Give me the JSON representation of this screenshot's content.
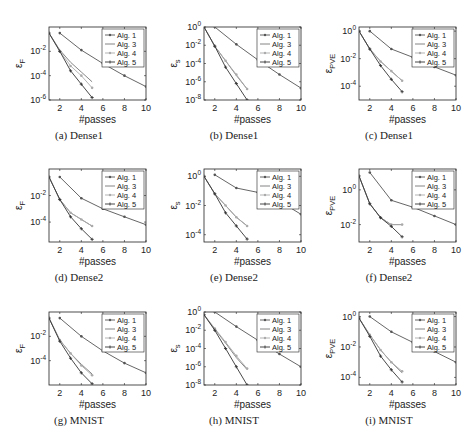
{
  "figure": {
    "panels": [
      {
        "id": "a",
        "caption": "(a) Dense1",
        "ylabel": "ε_F",
        "ylabel_main": "ε",
        "ylabel_sub": "F",
        "xlabel": "#passes"
      },
      {
        "id": "b",
        "caption": "(b) Dense1",
        "ylabel": "ε_s",
        "ylabel_main": "ε",
        "ylabel_sub": "s",
        "xlabel": "#passes"
      },
      {
        "id": "c",
        "caption": "(c) Dense1",
        "ylabel": "ε_PVE",
        "ylabel_main": "ε",
        "ylabel_sub": "PVE",
        "xlabel": "#passes"
      },
      {
        "id": "d",
        "caption": "(d) Dense2",
        "ylabel": "ε_F",
        "ylabel_main": "ε",
        "ylabel_sub": "F",
        "xlabel": "#passes"
      },
      {
        "id": "e",
        "caption": "(e) Dense2",
        "ylabel": "ε_s",
        "ylabel_main": "ε",
        "ylabel_sub": "s",
        "xlabel": "#passes"
      },
      {
        "id": "f",
        "caption": "(f) Dense2",
        "ylabel": "ε_PVE",
        "ylabel_main": "ε",
        "ylabel_sub": "PVE",
        "xlabel": "#passes"
      },
      {
        "id": "g",
        "caption": "(g) MNIST",
        "ylabel": "ε_F",
        "ylabel_main": "ε",
        "ylabel_sub": "F",
        "xlabel": "#passes"
      },
      {
        "id": "h",
        "caption": "(h) MNIST",
        "ylabel": "ε_s",
        "ylabel_main": "ε",
        "ylabel_sub": "s",
        "xlabel": "#passes"
      },
      {
        "id": "i",
        "caption": "(i) MNIST",
        "ylabel": "ε_PVE",
        "ylabel_main": "ε",
        "ylabel_sub": "PVE",
        "xlabel": "#passes"
      }
    ],
    "legend": [
      "Alg. 1",
      "Alg. 3",
      "Alg. 4",
      "Alg. 5"
    ],
    "colors": {
      "alg1": "#555555",
      "alg3": "#777777",
      "alg4": "#aaaaaa",
      "alg5": "#333333",
      "axis": "#222222"
    }
  },
  "chart_data": [
    {
      "id": "a",
      "type": "line",
      "title": "(a) Dense1",
      "xlabel": "#passes",
      "ylabel": "ε_F",
      "yscale": "log",
      "xlim": [
        1,
        10
      ],
      "ylim_exp": [
        -6,
        0
      ],
      "xticks": [
        2,
        4,
        6,
        8,
        10
      ],
      "yticks": [
        "10^-2",
        "10^-4",
        "10^-6"
      ],
      "series": [
        {
          "name": "Alg. 1",
          "x": [
            2,
            4,
            6,
            8,
            10
          ],
          "y_exp": [
            -0.5,
            -1.9,
            -3.0,
            -4.0,
            -4.9
          ]
        },
        {
          "name": "Alg. 3",
          "x": [
            1,
            2,
            3,
            4,
            5
          ],
          "y_exp": [
            -0.5,
            -1.9,
            -2.9,
            -3.7,
            -4.5
          ]
        },
        {
          "name": "Alg. 4",
          "x": [
            1,
            2,
            3,
            4,
            5
          ],
          "y_exp": [
            -0.5,
            -2.0,
            -3.2,
            -4.0,
            -5.0
          ]
        },
        {
          "name": "Alg. 5",
          "x": [
            1,
            2,
            3,
            4,
            5
          ],
          "y_exp": [
            -0.5,
            -2.0,
            -3.6,
            -4.7,
            -5.8
          ]
        }
      ]
    },
    {
      "id": "b",
      "type": "line",
      "title": "(b) Dense1",
      "xlabel": "#passes",
      "ylabel": "ε_s",
      "yscale": "log",
      "xlim": [
        1,
        10
      ],
      "ylim_exp": [
        -8,
        0
      ],
      "xticks": [
        2,
        4,
        6,
        8,
        10
      ],
      "yticks": [
        "10^0",
        "10^-2",
        "10^-4",
        "10^-6",
        "10^-8"
      ],
      "series": [
        {
          "name": "Alg. 1",
          "x": [
            2,
            4,
            6,
            8,
            10
          ],
          "y_exp": [
            0,
            -1.9,
            -3.6,
            -5.2,
            -6.7
          ]
        },
        {
          "name": "Alg. 3",
          "x": [
            1,
            2,
            3,
            4,
            5
          ],
          "y_exp": [
            0,
            -2.1,
            -3.7,
            -5.3,
            -6.8
          ]
        },
        {
          "name": "Alg. 4",
          "x": [
            1,
            2,
            3,
            4,
            5
          ],
          "y_exp": [
            0,
            -2.1,
            -3.7,
            -5.2,
            -6.8
          ]
        },
        {
          "name": "Alg. 5",
          "x": [
            1,
            2,
            3,
            4,
            5
          ],
          "y_exp": [
            0,
            -2.1,
            -4.4,
            -6.2,
            -8.0
          ]
        }
      ]
    },
    {
      "id": "c",
      "type": "line",
      "title": "(c) Dense1",
      "xlabel": "#passes",
      "ylabel": "ε_PVE",
      "yscale": "log",
      "xlim": [
        1,
        10
      ],
      "ylim_exp": [
        -5,
        0.3
      ],
      "xticks": [
        2,
        4,
        6,
        8,
        10
      ],
      "yticks": [
        "10^0",
        "10^-2",
        "10^-4"
      ],
      "series": [
        {
          "name": "Alg. 1",
          "x": [
            2,
            4,
            6,
            8,
            10
          ],
          "y_exp": [
            0,
            -1.3,
            -1.9,
            -2.6,
            -3.2
          ]
        },
        {
          "name": "Alg. 3",
          "x": [
            1,
            2,
            3,
            4,
            5
          ],
          "y_exp": [
            0,
            -1.3,
            -2.2,
            -2.9,
            -3.6
          ]
        },
        {
          "name": "Alg. 4",
          "x": [
            1,
            2,
            3,
            4,
            5
          ],
          "y_exp": [
            0,
            -1.3,
            -2.2,
            -2.9,
            -3.6
          ]
        },
        {
          "name": "Alg. 5",
          "x": [
            1,
            2,
            3,
            4,
            5
          ],
          "y_exp": [
            0,
            -1.3,
            -2.5,
            -3.5,
            -4.4
          ]
        }
      ]
    },
    {
      "id": "d",
      "type": "line",
      "title": "(d) Dense2",
      "xlabel": "#passes",
      "ylabel": "ε_F",
      "yscale": "log",
      "xlim": [
        1,
        10
      ],
      "ylim_exp": [
        -5.5,
        0
      ],
      "xticks": [
        2,
        4,
        6,
        8,
        10
      ],
      "yticks": [
        "10^-2",
        "10^-4"
      ],
      "series": [
        {
          "name": "Alg. 1",
          "x": [
            2,
            4,
            6,
            8,
            10
          ],
          "y_exp": [
            -0.6,
            -2.2,
            -3.0,
            -3.6,
            -4.2
          ]
        },
        {
          "name": "Alg. 3",
          "x": [
            1,
            2,
            3,
            4,
            5
          ],
          "y_exp": [
            -0.6,
            -2.3,
            -3.3,
            -3.8,
            -4.3
          ]
        },
        {
          "name": "Alg. 4",
          "x": [
            1,
            2,
            3,
            4,
            5
          ],
          "y_exp": [
            -0.6,
            -2.3,
            -3.3,
            -3.8,
            -4.3
          ]
        },
        {
          "name": "Alg. 5",
          "x": [
            1,
            2,
            3,
            4,
            5
          ],
          "y_exp": [
            -0.6,
            -2.3,
            -3.6,
            -4.5,
            -5.3
          ]
        }
      ]
    },
    {
      "id": "e",
      "type": "line",
      "title": "(e) Dense2",
      "xlabel": "#passes",
      "ylabel": "ε_s",
      "yscale": "log",
      "xlim": [
        1,
        10
      ],
      "ylim_exp": [
        -4.5,
        0.5
      ],
      "xticks": [
        2,
        4,
        6,
        8,
        10
      ],
      "yticks": [
        "10^0",
        "10^-2",
        "10^-4"
      ],
      "series": [
        {
          "name": "Alg. 1",
          "x": [
            2,
            4,
            6,
            8,
            10
          ],
          "y_exp": [
            0.1,
            -0.8,
            -1.1,
            -1.7,
            -2.6
          ]
        },
        {
          "name": "Alg. 3",
          "x": [
            1,
            2,
            3,
            4,
            5
          ],
          "y_exp": [
            0,
            -1.2,
            -2.0,
            -2.8,
            -3.4
          ]
        },
        {
          "name": "Alg. 4",
          "x": [
            1,
            2,
            3,
            4,
            5
          ],
          "y_exp": [
            0,
            -1.2,
            -2.0,
            -2.8,
            -3.4
          ]
        },
        {
          "name": "Alg. 5",
          "x": [
            1,
            2,
            3,
            4,
            5
          ],
          "y_exp": [
            0,
            -1.2,
            -2.5,
            -3.4,
            -4.3
          ]
        }
      ]
    },
    {
      "id": "f",
      "type": "line",
      "title": "(f) Dense2",
      "xlabel": "#passes",
      "ylabel": "ε_PVE",
      "yscale": "log",
      "xlim": [
        1,
        10
      ],
      "ylim_exp": [
        -3,
        1.2
      ],
      "xticks": [
        2,
        4,
        6,
        8,
        10
      ],
      "yticks": [
        "10^0",
        "10^-2"
      ],
      "series": [
        {
          "name": "Alg. 1",
          "x": [
            2,
            4,
            6,
            8,
            10
          ],
          "y_exp": [
            1.0,
            -0.6,
            -1.0,
            -1.5,
            -2.0
          ]
        },
        {
          "name": "Alg. 3",
          "x": [
            1,
            2,
            3,
            4,
            5
          ],
          "y_exp": [
            0.8,
            -0.8,
            -1.6,
            -2.0,
            -2.0
          ]
        },
        {
          "name": "Alg. 4",
          "x": [
            1,
            2,
            3,
            4,
            5
          ],
          "y_exp": [
            0.8,
            -0.8,
            -1.6,
            -2.0,
            -2.0
          ]
        },
        {
          "name": "Alg. 5",
          "x": [
            1,
            2,
            3,
            4,
            5
          ],
          "y_exp": [
            0.8,
            -0.8,
            -1.6,
            -2.1,
            -2.7
          ]
        }
      ]
    },
    {
      "id": "g",
      "type": "line",
      "title": "(g) MNIST",
      "xlabel": "#passes",
      "ylabel": "ε_F",
      "yscale": "log",
      "xlim": [
        1,
        10
      ],
      "ylim_exp": [
        -6,
        0
      ],
      "xticks": [
        2,
        4,
        6,
        8,
        10
      ],
      "yticks": [
        "10^-2",
        "10^-4"
      ],
      "series": [
        {
          "name": "Alg. 1",
          "x": [
            2,
            4,
            6,
            8,
            10
          ],
          "y_exp": [
            -0.5,
            -2.0,
            -3.2,
            -4.2,
            -5.0
          ]
        },
        {
          "name": "Alg. 3",
          "x": [
            1,
            2,
            3,
            4,
            5
          ],
          "y_exp": [
            -0.5,
            -2.3,
            -3.4,
            -4.3,
            -5.1
          ]
        },
        {
          "name": "Alg. 4",
          "x": [
            1,
            2,
            3,
            4,
            5
          ],
          "y_exp": [
            -0.5,
            -2.3,
            -3.4,
            -4.4,
            -5.2
          ]
        },
        {
          "name": "Alg. 5",
          "x": [
            1,
            2,
            3,
            4,
            5
          ],
          "y_exp": [
            -0.5,
            -2.4,
            -3.8,
            -5.0,
            -5.9
          ]
        }
      ]
    },
    {
      "id": "h",
      "type": "line",
      "title": "(h) MNIST",
      "xlabel": "#passes",
      "ylabel": "ε_s",
      "yscale": "log",
      "xlim": [
        1,
        10
      ],
      "ylim_exp": [
        -8,
        0
      ],
      "xticks": [
        2,
        4,
        6,
        8,
        10
      ],
      "yticks": [
        "10^0",
        "10^-2",
        "10^-4",
        "10^-6",
        "10^-8"
      ],
      "series": [
        {
          "name": "Alg. 1",
          "x": [
            2,
            4,
            6,
            8,
            10
          ],
          "y_exp": [
            0,
            -1.6,
            -3.1,
            -4.6,
            -6.0
          ]
        },
        {
          "name": "Alg. 3",
          "x": [
            1,
            2,
            3,
            4,
            5
          ],
          "y_exp": [
            -0.3,
            -1.9,
            -3.4,
            -5.0,
            -6.3
          ]
        },
        {
          "name": "Alg. 4",
          "x": [
            1,
            2,
            3,
            4,
            5
          ],
          "y_exp": [
            -0.3,
            -1.8,
            -3.3,
            -4.8,
            -6.2
          ]
        },
        {
          "name": "Alg. 5",
          "x": [
            1,
            2,
            3,
            4,
            5
          ],
          "y_exp": [
            -0.3,
            -2.0,
            -4.0,
            -6.0,
            -8.0
          ]
        }
      ]
    },
    {
      "id": "i",
      "type": "line",
      "title": "(i) MNIST",
      "xlabel": "#passes",
      "ylabel": "ε_PVE",
      "yscale": "log",
      "xlim": [
        1,
        10
      ],
      "ylim_exp": [
        -4.5,
        0.3
      ],
      "xticks": [
        2,
        4,
        6,
        8,
        10
      ],
      "yticks": [
        "10^0",
        "10^-2",
        "10^-4"
      ],
      "series": [
        {
          "name": "Alg. 1",
          "x": [
            2,
            4,
            6,
            8,
            10
          ],
          "y_exp": [
            0,
            -1.0,
            -1.7,
            -2.3,
            -3.0
          ]
        },
        {
          "name": "Alg. 3",
          "x": [
            1,
            2,
            3,
            4,
            5
          ],
          "y_exp": [
            -0.1,
            -1.2,
            -2.2,
            -3.0,
            -3.7
          ]
        },
        {
          "name": "Alg. 4",
          "x": [
            1,
            2,
            3,
            4,
            5
          ],
          "y_exp": [
            -0.1,
            -1.2,
            -2.2,
            -3.0,
            -3.6
          ]
        },
        {
          "name": "Alg. 5",
          "x": [
            1,
            2,
            3,
            4,
            5
          ],
          "y_exp": [
            -0.1,
            -1.3,
            -2.6,
            -3.5,
            -4.3
          ]
        }
      ]
    }
  ]
}
